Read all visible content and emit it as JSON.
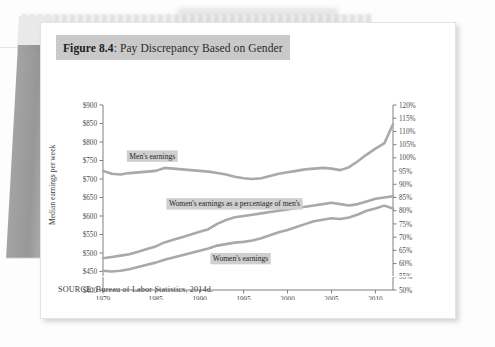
{
  "figure": {
    "label_strong": "Figure 8.4",
    "label_rest": ": Pay Discrepancy Based on Gender",
    "source": "SOURCE: Bureau of Labor Statistics, 2014d."
  },
  "colors": {
    "line": "#a9a9a9",
    "title_band": "#c9c9c9",
    "label_band": "#cfcfcf",
    "axis": "#808080",
    "card": "#ffffff"
  },
  "chart_data": {
    "type": "line",
    "title": "Pay Discrepancy Based on Gender",
    "xlabel": "",
    "ylabel": "Median earnings per week",
    "y2label": "",
    "grid": false,
    "legend": "inline-annotations",
    "xlim": [
      1979,
      2012
    ],
    "ylim": [
      400,
      900
    ],
    "y2lim": [
      50,
      120
    ],
    "x_ticks": [
      1979,
      1985,
      1990,
      1995,
      2000,
      2005,
      2010
    ],
    "y_ticks": [
      "$400",
      "$450",
      "$500",
      "$550",
      "$600",
      "$650",
      "$700",
      "$750",
      "$800",
      "$850",
      "$900"
    ],
    "y2_ticks": [
      "50%",
      "55%",
      "60%",
      "65%",
      "70%",
      "75%",
      "80%",
      "85%",
      "90%",
      "95%",
      "100%",
      "105%",
      "110%",
      "115%",
      "120%"
    ],
    "x": [
      1979,
      1980,
      1981,
      1982,
      1983,
      1984,
      1985,
      1986,
      1987,
      1988,
      1989,
      1990,
      1991,
      1992,
      1993,
      1994,
      1995,
      1996,
      1997,
      1998,
      1999,
      2000,
      2001,
      2002,
      2003,
      2004,
      2005,
      2006,
      2007,
      2008,
      2009,
      2010,
      2011,
      2012
    ],
    "series": [
      {
        "name": "Men's earnings",
        "axis": "left",
        "units": "dollars per week",
        "values": [
          722,
          714,
          712,
          716,
          718,
          720,
          722,
          730,
          728,
          726,
          724,
          722,
          720,
          716,
          712,
          706,
          702,
          700,
          702,
          708,
          714,
          718,
          722,
          726,
          728,
          730,
          728,
          724,
          732,
          748,
          766,
          782,
          796,
          848
        ]
      },
      {
        "name": "Women's earnings",
        "axis": "left",
        "units": "dollars per week",
        "values": [
          452,
          450,
          452,
          456,
          462,
          468,
          474,
          482,
          488,
          494,
          500,
          506,
          512,
          520,
          524,
          528,
          530,
          534,
          540,
          548,
          556,
          562,
          570,
          578,
          586,
          590,
          594,
          592,
          596,
          604,
          614,
          620,
          628,
          620
        ]
      },
      {
        "name": "Women's earnings as a percentage of men's",
        "axis": "right",
        "units": "percent",
        "values": [
          62.0,
          62.5,
          63.0,
          63.5,
          64.5,
          65.5,
          66.5,
          68.0,
          69.0,
          70.0,
          71.0,
          72.0,
          73.0,
          75.0,
          76.5,
          77.5,
          78.0,
          78.5,
          79.0,
          79.5,
          80.0,
          80.5,
          81.0,
          81.5,
          82.0,
          82.5,
          83.0,
          82.5,
          82.0,
          82.5,
          83.5,
          84.5,
          85.0,
          85.5
        ]
      }
    ],
    "annotations": [
      {
        "text": "Men's earnings",
        "x": 1982.0,
        "y_value": 755,
        "axis": "left"
      },
      {
        "text": "Women's earnings as a percentage of men's",
        "x": 1986.5,
        "y_value": 626,
        "axis": "left"
      },
      {
        "text": "Women's earnings",
        "x": 1991.5,
        "y_value": 478,
        "axis": "left"
      }
    ]
  }
}
